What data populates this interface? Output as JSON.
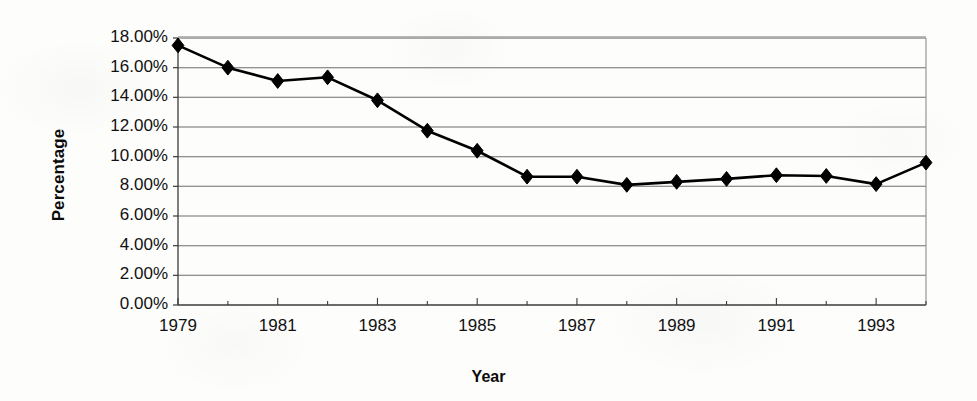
{
  "chart_data": {
    "type": "line",
    "title": "",
    "xlabel": "Year",
    "ylabel": "Percentage",
    "x": [
      1979,
      1980,
      1981,
      1982,
      1983,
      1984,
      1985,
      1986,
      1987,
      1988,
      1989,
      1990,
      1991,
      1992,
      1993,
      1994
    ],
    "values": [
      17.5,
      16.0,
      15.1,
      15.35,
      13.8,
      11.75,
      10.4,
      8.65,
      8.65,
      8.1,
      8.3,
      8.5,
      8.75,
      8.7,
      8.15,
      9.6
    ],
    "series": [
      {
        "name": "Percentage",
        "values": [
          17.5,
          16.0,
          15.1,
          15.35,
          13.8,
          11.75,
          10.4,
          8.65,
          8.65,
          8.1,
          8.3,
          8.5,
          8.75,
          8.7,
          8.15,
          9.6
        ]
      }
    ],
    "xlim": [
      1979,
      1994
    ],
    "ylim": [
      0,
      18
    ],
    "y_ticks": [
      0,
      2,
      4,
      6,
      8,
      10,
      12,
      14,
      16,
      18
    ],
    "y_tick_labels": [
      "0.00%",
      "2.00%",
      "4.00%",
      "6.00%",
      "8.00%",
      "10.00%",
      "12.00%",
      "14.00%",
      "16.00%",
      "18.00%"
    ],
    "x_ticks": [
      1979,
      1981,
      1983,
      1985,
      1987,
      1989,
      1991,
      1993
    ],
    "x_tick_labels": [
      "1979",
      "1981",
      "1983",
      "1985",
      "1987",
      "1989",
      "1991",
      "1993"
    ],
    "grid": "horizontal",
    "legend": "none",
    "marker": "diamond",
    "line_color": "#000000",
    "marker_color": "#000000",
    "grid_color": "#6e6e6e",
    "axis_color": "#4a4a4a",
    "background_color": "#ffffff"
  }
}
